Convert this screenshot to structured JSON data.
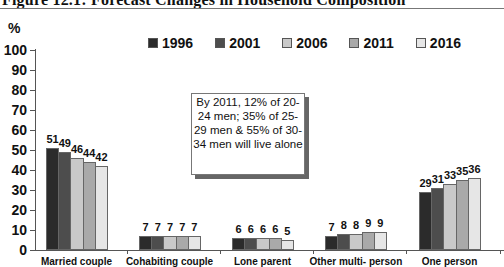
{
  "title": "Figure 12.1: Forecast Changes in Household Composition",
  "y_unit": "%",
  "annotation": "By 2011, 12% of 20-24 men; 35% of 25-29 men & 55% of 30-34 men will live alone",
  "chart_data": {
    "type": "bar",
    "title": "Figure 12.1: Forecast Changes in Household Composition",
    "xlabel": "",
    "ylabel": "%",
    "ylim": [
      0,
      100
    ],
    "yticks": [
      0,
      10,
      20,
      30,
      40,
      50,
      60,
      70,
      80,
      90,
      100
    ],
    "grid": false,
    "legend_position": "top",
    "categories": [
      "Married couple",
      "Cohabiting couple",
      "Lone parent",
      "Other multi- person",
      "One person"
    ],
    "series": [
      {
        "name": "1996",
        "color": "#2b2b2b",
        "values": [
          51,
          7,
          6,
          7,
          29
        ]
      },
      {
        "name": "2001",
        "color": "#4d4d4d",
        "values": [
          49,
          7,
          6,
          8,
          31
        ]
      },
      {
        "name": "2006",
        "color": "#c9c9c9",
        "values": [
          46,
          7,
          6,
          8,
          33
        ]
      },
      {
        "name": "2011",
        "color": "#a9a9a9",
        "values": [
          44,
          7,
          6,
          9,
          35
        ]
      },
      {
        "name": "2016",
        "color": "#e6e6e6",
        "values": [
          42,
          7,
          5,
          9,
          36
        ]
      }
    ],
    "annotations": [
      "By 2011, 12% of 20-24 men; 35% of 25-29 men & 55% of 30-34 men will live alone"
    ]
  }
}
